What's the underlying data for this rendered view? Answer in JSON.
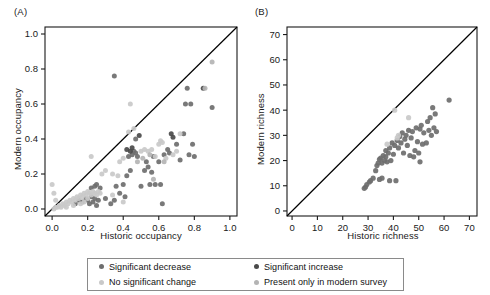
{
  "figure": {
    "background": "#ffffff",
    "panels": [
      {
        "id": "A",
        "label": "(A)",
        "xlabel": "Historic occupancy",
        "ylabel": "Modern occupancy"
      },
      {
        "id": "B",
        "label": "(B)",
        "xlabel": "Historic richness",
        "ylabel": "Modern richness"
      }
    ]
  },
  "legend": {
    "position": "bottom-center",
    "border_color": "#8a8a8a",
    "items": [
      {
        "label": "Significant decrease",
        "color": "#6e6e6e"
      },
      {
        "label": "Significant increase",
        "color": "#4a4a4a"
      },
      {
        "label": "No significant change",
        "color": "#c9c9c9"
      },
      {
        "label": "Present only in modern survey",
        "color": "#b4b4b4"
      }
    ]
  },
  "colors": {
    "significant_decrease": "#6e6e6e",
    "significant_increase": "#4a4a4a",
    "no_significant_change": "#c9c9c9",
    "present_only_modern": "#b4b4b4",
    "axis": "#1a1a1a",
    "reference_line": "#000000"
  },
  "chart_data": [
    {
      "type": "scatter",
      "panel": "A",
      "title": "(A)",
      "xlabel": "Historic occupancy",
      "ylabel": "Modern occupancy",
      "xlim": [
        -0.04,
        1.04
      ],
      "ylim": [
        -0.04,
        1.04
      ],
      "xticks": [
        0.0,
        0.2,
        0.4,
        0.6,
        0.8,
        1.0
      ],
      "yticks": [
        0.0,
        0.2,
        0.4,
        0.6,
        0.8,
        1.0
      ],
      "xticklabels": [
        "0.0",
        "0.2",
        "0.4",
        "0.6",
        "0.8",
        "1.0"
      ],
      "yticklabels": [
        "0.0",
        "0.2",
        "0.4",
        "0.6",
        "0.8",
        "1.0"
      ],
      "grid": false,
      "reference_line": {
        "type": "identity",
        "from": [
          0,
          0
        ],
        "to": [
          1.0,
          1.0
        ]
      },
      "series": [
        {
          "name": "Significant decrease",
          "color": "#6e6e6e",
          "points": [
            [
              0.13,
              0.03
            ],
            [
              0.15,
              0.05
            ],
            [
              0.17,
              0.04
            ],
            [
              0.19,
              0.06
            ],
            [
              0.2,
              0.05
            ],
            [
              0.21,
              0.03
            ],
            [
              0.22,
              0.07
            ],
            [
              0.23,
              0.04
            ],
            [
              0.24,
              0.06
            ],
            [
              0.25,
              0.02
            ],
            [
              0.26,
              0.05
            ],
            [
              0.22,
              0.12
            ],
            [
              0.24,
              0.13
            ],
            [
              0.25,
              0.14
            ],
            [
              0.27,
              0.12
            ],
            [
              0.3,
              0.06
            ],
            [
              0.33,
              0.03
            ],
            [
              0.35,
              0.05
            ],
            [
              0.36,
              0.13
            ],
            [
              0.38,
              0.09
            ],
            [
              0.4,
              0.14
            ],
            [
              0.41,
              0.07
            ],
            [
              0.42,
              0.19
            ],
            [
              0.43,
              0.3
            ],
            [
              0.44,
              0.22
            ],
            [
              0.45,
              0.31
            ],
            [
              0.46,
              0.33
            ],
            [
              0.47,
              0.32
            ],
            [
              0.47,
              0.4
            ],
            [
              0.48,
              0.3
            ],
            [
              0.5,
              0.13
            ],
            [
              0.52,
              0.22
            ],
            [
              0.53,
              0.27
            ],
            [
              0.54,
              0.24
            ],
            [
              0.55,
              0.14
            ],
            [
              0.56,
              0.21
            ],
            [
              0.57,
              0.3
            ],
            [
              0.58,
              0.14
            ],
            [
              0.6,
              0.27
            ],
            [
              0.61,
              0.14
            ],
            [
              0.62,
              0.03
            ],
            [
              0.63,
              0.31
            ],
            [
              0.65,
              0.34
            ],
            [
              0.66,
              0.32
            ],
            [
              0.7,
              0.37
            ],
            [
              0.72,
              0.28
            ],
            [
              0.74,
              0.43
            ],
            [
              0.75,
              0.6
            ],
            [
              0.76,
              0.69
            ],
            [
              0.77,
              0.31
            ],
            [
              0.78,
              0.6
            ],
            [
              0.79,
              0.37
            ],
            [
              0.8,
              0.3
            ],
            [
              0.9,
              0.58
            ],
            [
              0.35,
              0.76
            ]
          ]
        },
        {
          "name": "Significant increase",
          "color": "#4a4a4a",
          "points": [
            [
              0.42,
              0.34
            ],
            [
              0.44,
              0.33
            ],
            [
              0.45,
              0.35
            ],
            [
              0.49,
              0.42
            ],
            [
              0.67,
              0.43
            ],
            [
              0.68,
              0.41
            ],
            [
              0.85,
              0.69
            ]
          ]
        },
        {
          "name": "No significant change",
          "color": "#c9c9c9",
          "points": [
            [
              0.01,
              0.0
            ],
            [
              0.02,
              0.01
            ],
            [
              0.03,
              0.01
            ],
            [
              0.04,
              0.02
            ],
            [
              0.05,
              0.01
            ],
            [
              0.06,
              0.03
            ],
            [
              0.07,
              0.02
            ],
            [
              0.08,
              0.04
            ],
            [
              0.09,
              0.03
            ],
            [
              0.1,
              0.05
            ],
            [
              0.11,
              0.04
            ],
            [
              0.12,
              0.06
            ],
            [
              0.13,
              0.05
            ],
            [
              0.14,
              0.07
            ],
            [
              0.15,
              0.06
            ],
            [
              0.16,
              0.08
            ],
            [
              0.17,
              0.07
            ],
            [
              0.18,
              0.09
            ],
            [
              0.19,
              0.08
            ],
            [
              0.2,
              0.1
            ],
            [
              0.21,
              0.09
            ],
            [
              0.22,
              0.08
            ],
            [
              0.23,
              0.1
            ],
            [
              0.24,
              0.09
            ],
            [
              0.25,
              0.08
            ],
            [
              0.26,
              0.1
            ],
            [
              0.27,
              0.09
            ],
            [
              0.18,
              0.04
            ],
            [
              0.2,
              0.06
            ],
            [
              0.16,
              0.03
            ],
            [
              0.12,
              0.02
            ],
            [
              0.08,
              0.01
            ],
            [
              0.28,
              0.2
            ],
            [
              0.3,
              0.22
            ],
            [
              0.22,
              0.3
            ],
            [
              0.34,
              0.2
            ],
            [
              0.38,
              0.27
            ],
            [
              0.4,
              0.29
            ],
            [
              0.43,
              0.44
            ],
            [
              0.44,
              0.6
            ],
            [
              0.46,
              0.46
            ],
            [
              0.5,
              0.33
            ],
            [
              0.52,
              0.34
            ],
            [
              0.54,
              0.33
            ],
            [
              0.56,
              0.34
            ],
            [
              0.58,
              0.3
            ],
            [
              0.6,
              0.37
            ],
            [
              0.61,
              0.39
            ],
            [
              0.62,
              0.38
            ],
            [
              0.64,
              0.29
            ],
            [
              0.68,
              0.31
            ],
            [
              0.7,
              0.33
            ],
            [
              0.72,
              0.43
            ],
            [
              0.37,
              0.19
            ],
            [
              0.4,
              0.04
            ],
            [
              0.34,
              0.08
            ],
            [
              0.0,
              0.14
            ],
            [
              0.01,
              0.09
            ],
            [
              0.02,
              0.05
            ]
          ]
        },
        {
          "name": "Present only in modern survey",
          "color": "#b4b4b4",
          "points": [
            [
              0.48,
              0.27
            ],
            [
              0.51,
              0.29
            ],
            [
              0.55,
              0.31
            ],
            [
              0.63,
              0.27
            ],
            [
              0.86,
              0.69
            ],
            [
              0.9,
              0.84
            ],
            [
              0.57,
              0.17
            ]
          ]
        }
      ]
    },
    {
      "type": "scatter",
      "panel": "B",
      "title": "(B)",
      "xlabel": "Historic richness",
      "ylabel": "Modern richness",
      "xlim": [
        -2,
        73
      ],
      "ylim": [
        -2,
        73
      ],
      "xticks": [
        0,
        10,
        20,
        30,
        40,
        50,
        60,
        70
      ],
      "yticks": [
        0,
        10,
        20,
        30,
        40,
        50,
        60,
        70
      ],
      "xticklabels": [
        "0",
        "10",
        "20",
        "30",
        "40",
        "50",
        "60",
        "70"
      ],
      "yticklabels": [
        "0",
        "10",
        "20",
        "30",
        "40",
        "50",
        "60",
        "70"
      ],
      "grid": false,
      "reference_line": {
        "type": "identity",
        "from": [
          0,
          0
        ],
        "to": [
          72,
          72
        ]
      },
      "series": [
        {
          "name": "Significant decrease",
          "color": "#6e6e6e",
          "points": [
            [
              28.5,
              9.0
            ],
            [
              29.0,
              9.5
            ],
            [
              29.5,
              10.5
            ],
            [
              30.5,
              11.5
            ],
            [
              31.0,
              12.0
            ],
            [
              32.0,
              13.0
            ],
            [
              33.0,
              16.0
            ],
            [
              33.5,
              18.0
            ],
            [
              34.0,
              19.0
            ],
            [
              34.5,
              20.5
            ],
            [
              35.0,
              21.0
            ],
            [
              35.5,
              19.0
            ],
            [
              36.0,
              22.0
            ],
            [
              36.5,
              20.0
            ],
            [
              37.0,
              21.5
            ],
            [
              37.0,
              24.0
            ],
            [
              37.5,
              19.5
            ],
            [
              38.0,
              23.0
            ],
            [
              38.5,
              25.0
            ],
            [
              39.0,
              20.0
            ],
            [
              39.5,
              27.0
            ],
            [
              40.0,
              22.5
            ],
            [
              40.5,
              26.0
            ],
            [
              41.0,
              12.0
            ],
            [
              41.5,
              28.0
            ],
            [
              42.0,
              25.0
            ],
            [
              42.5,
              29.5
            ],
            [
              43.0,
              27.0
            ],
            [
              43.5,
              31.0
            ],
            [
              44.0,
              23.0
            ],
            [
              44.5,
              28.5
            ],
            [
              45.0,
              30.0
            ],
            [
              45.5,
              26.0
            ],
            [
              46.0,
              32.0
            ],
            [
              46.5,
              22.0
            ],
            [
              47.0,
              29.0
            ],
            [
              47.5,
              31.5
            ],
            [
              48.0,
              21.5
            ],
            [
              48.5,
              24.0
            ],
            [
              49.0,
              33.0
            ],
            [
              49.5,
              27.5
            ],
            [
              50.0,
              23.0
            ],
            [
              50.5,
              32.5
            ],
            [
              50.5,
              19.5
            ],
            [
              51.0,
              34.0
            ],
            [
              51.5,
              26.5
            ],
            [
              52.0,
              31.0
            ],
            [
              53.0,
              27.0
            ],
            [
              53.5,
              35.5
            ],
            [
              54.0,
              32.0
            ],
            [
              54.5,
              37.0
            ],
            [
              55.0,
              30.0
            ],
            [
              55.5,
              41.0
            ],
            [
              56.0,
              33.0
            ],
            [
              56.5,
              38.5
            ],
            [
              57.0,
              31.5
            ],
            [
              62.0,
              44.0
            ],
            [
              35.5,
              13.0
            ],
            [
              34.5,
              12.5
            ],
            [
              38.5,
              12.0
            ]
          ]
        },
        {
          "name": "No significant change",
          "color": "#c9c9c9",
          "points": [
            [
              40.5,
              40.0
            ],
            [
              46.0,
              37.0
            ],
            [
              42.0,
              30.0
            ],
            [
              37.5,
              26.5
            ],
            [
              41.5,
              29.0
            ]
          ]
        }
      ]
    }
  ]
}
